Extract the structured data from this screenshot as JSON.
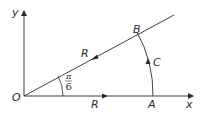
{
  "diagram": {
    "type": "contour",
    "labels": {
      "y_axis": "y",
      "x_axis": "x",
      "origin": "O",
      "point_a": "A",
      "point_b": "B",
      "radius_ray": "R",
      "radius_axis": "R",
      "arc": "C",
      "angle_num": "π",
      "angle_den": "6"
    },
    "colors": {
      "stroke": "#2a2a2a",
      "background": "#ffffff"
    }
  }
}
